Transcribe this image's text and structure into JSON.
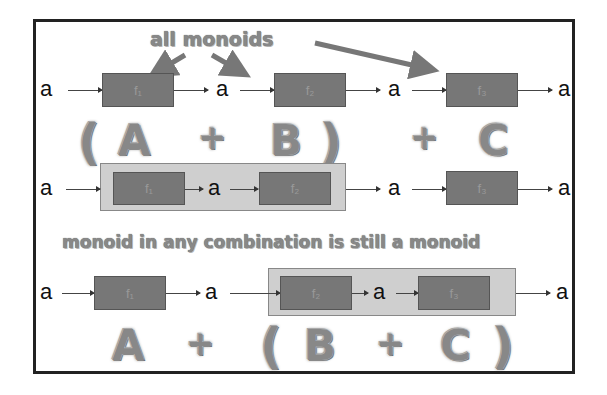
{
  "diagram": {
    "caption_top": "all monoids",
    "caption_middle": "monoid in any combination is still a monoid",
    "row1": {
      "labels": [
        "a",
        "a",
        "a",
        "a"
      ],
      "boxes": [
        "f₁",
        "f₂",
        "f₃"
      ]
    },
    "row2": {
      "labels": [
        "a",
        "a",
        "a",
        "a"
      ],
      "boxes": [
        "f₁",
        "f₂",
        "f₃"
      ],
      "expr": [
        "(",
        "A",
        "+",
        "B",
        ")",
        "+",
        "C"
      ]
    },
    "row3": {
      "labels": [
        "a",
        "a",
        "a",
        "a"
      ],
      "boxes": [
        "f₁",
        "f₂",
        "f₃"
      ],
      "expr": [
        "A",
        "+",
        "(",
        "B",
        "+",
        "C",
        ")"
      ]
    },
    "colors": {
      "box": "#777777",
      "group": "#cfcfcf",
      "letters": "#888888",
      "frame": "#222222"
    }
  }
}
